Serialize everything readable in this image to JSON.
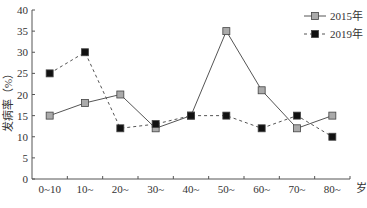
{
  "chart_data": {
    "type": "line",
    "title": "",
    "xlabel": "岁",
    "ylabel": "发病率（%）",
    "categories": [
      "0~10",
      "10~",
      "20~",
      "30~",
      "40~",
      "50~",
      "60~",
      "70~",
      "80~"
    ],
    "series": [
      {
        "name": "2015年",
        "style": "solid",
        "marker": "gray-square",
        "color": "#999999",
        "values": [
          15,
          18,
          20,
          12,
          15,
          35,
          21,
          12,
          15
        ]
      },
      {
        "name": "2019年",
        "style": "dashed",
        "marker": "black-square",
        "color": "#111111",
        "values": [
          25,
          30,
          12,
          13,
          15,
          15,
          12,
          15,
          10
        ]
      }
    ],
    "ylim": [
      0,
      40
    ],
    "yticks": [
      0,
      5,
      10,
      15,
      20,
      25,
      30,
      35,
      40
    ],
    "grid": false,
    "legend_position": "top-right"
  }
}
